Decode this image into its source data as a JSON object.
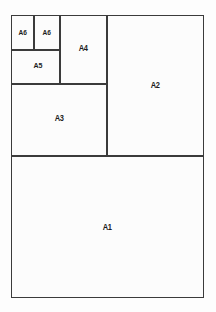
{
  "diagram": {
    "type": "paper-size-subdivision",
    "canvas": {
      "width": 216,
      "height": 312
    },
    "colors": {
      "background": "#fdfdfd",
      "region_fill": "#fcfcfc",
      "stroke": "#3b3b3b",
      "label_text": "#1c1c1c"
    },
    "frame": {
      "x": 11,
      "y": 15,
      "width": 193,
      "height": 283
    },
    "regions": [
      {
        "id": "a1",
        "label": "A1",
        "x": 11,
        "y": 156,
        "width": 193,
        "height": 142
      },
      {
        "id": "a2",
        "label": "A2",
        "x": 107,
        "y": 15,
        "width": 97,
        "height": 141
      },
      {
        "id": "a3",
        "label": "A3",
        "x": 11,
        "y": 84,
        "width": 96,
        "height": 72
      },
      {
        "id": "a4",
        "label": "A4",
        "x": 60,
        "y": 15,
        "width": 47,
        "height": 69
      },
      {
        "id": "a5",
        "label": "A5",
        "x": 11,
        "y": 50,
        "width": 49,
        "height": 34
      },
      {
        "id": "a6-left",
        "label": "A6",
        "x": 11,
        "y": 15,
        "width": 23,
        "height": 35
      },
      {
        "id": "a6-right",
        "label": "A6",
        "x": 34,
        "y": 15,
        "width": 26,
        "height": 35
      }
    ]
  }
}
